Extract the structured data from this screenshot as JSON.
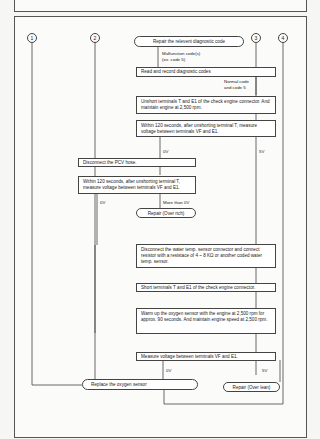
{
  "diagram": {
    "connectors": [
      "1",
      "2",
      "3",
      "4"
    ],
    "nodes": {
      "start": "Repair the relevent diagnostic code",
      "read_codes": "Read and record diagnostic codes",
      "unshort": "Unshort terminals T and E1 of the check engine connector. And maintain engine at 2,500 rpm.",
      "measure1": "Within 120 seconds, after unshorting terminal T, measure voltage between terminals VF and E1.",
      "pcv": "Disconnect the PCV hose.",
      "measure2": "Within 120 seconds, after unshorting terminal T, measure voltage between terminals VF and E1.",
      "repair_rich": "Repair (Over rich)",
      "water_temp": "Disconnect the water temp. sensor connector and connect resistor with a resistace of 4 ~ 8 KΩ or another coded water temp. sensor.",
      "short": "Short terminals T and E1 of the check engine connector.",
      "warmup": "Warm up the oxygen sensor with the engine at 2,500 rpm for approx. 90 seconds. And maintain engine speed at 2,500 rpm.",
      "measure3": "Measure voltage between terminals VF and E1.",
      "replace": "Replace the oxygen sensor",
      "repair_lean": "Repair (Over lean)"
    },
    "edge_labels": {
      "malfunction": "Malfunction code(s)",
      "malfunction_ex": "(ex. code 5)",
      "normal": "Normal code",
      "normal2": "and code 5",
      "m1_0v": "0V",
      "m1_5v": "5V",
      "m2_0v": "0V",
      "m2_more": "More than 0V",
      "m3_0v": "0V",
      "m3_5v": "5V"
    }
  }
}
